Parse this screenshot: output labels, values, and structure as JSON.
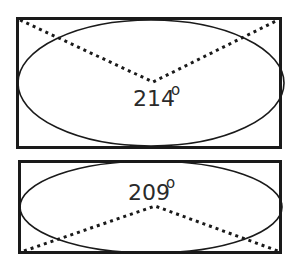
{
  "diagrams": [
    {
      "name": "top-diagram",
      "angle_value": "214",
      "angle_unit": "o",
      "apex_position": "center",
      "rays_toward": "top-corners"
    },
    {
      "name": "bottom-diagram",
      "angle_value": "209",
      "angle_unit": "o",
      "apex_position": "center",
      "rays_toward": "bottom-corners"
    }
  ],
  "colors": {
    "stroke": "#1a1a1a",
    "text": "#2a2a2a",
    "background": "#ffffff"
  }
}
